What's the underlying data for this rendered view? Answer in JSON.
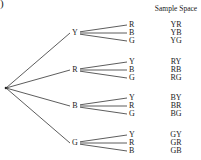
{
  "figure": {
    "corner_mark": ")",
    "sample_space_header": "Sample Space",
    "root": {
      "x": 6,
      "y": 88
    },
    "branches": [
      {
        "label": "Y",
        "y": 33,
        "children": [
          "R",
          "B",
          "G"
        ],
        "outcomes": [
          "YR",
          "YB",
          "YG"
        ]
      },
      {
        "label": "R",
        "y": 70,
        "children": [
          "Y",
          "B",
          "G"
        ],
        "outcomes": [
          "RY",
          "RB",
          "RG"
        ]
      },
      {
        "label": "B",
        "y": 106,
        "children": [
          "Y",
          "R",
          "G"
        ],
        "outcomes": [
          "BY",
          "BR",
          "BG"
        ]
      },
      {
        "label": "G",
        "y": 143,
        "children": [
          "Y",
          "R",
          "B"
        ],
        "outcomes": [
          "GY",
          "GR",
          "GB"
        ]
      }
    ]
  }
}
